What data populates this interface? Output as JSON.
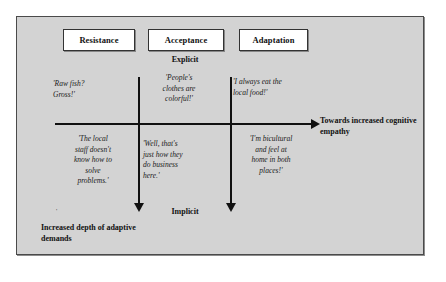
{
  "diagram": {
    "background_color": "#d3d3d3",
    "line_color": "#111111",
    "box_fill_color": "#ffffff",
    "categories": [
      {
        "id": "resistance",
        "label": "Resistance"
      },
      {
        "id": "acceptance",
        "label": "Acceptance"
      },
      {
        "id": "adaptation",
        "label": "Adaptation"
      }
    ],
    "axes": {
      "vertical_top_label": "Explicit",
      "vertical_bottom_label": "Implicit",
      "horizontal_caption_line1": "Towards increased",
      "horizontal_caption_line2": "cognitive empathy",
      "vertical_caption_line1": "Increased depth of",
      "vertical_caption_line2": "adaptive demands"
    },
    "quotes": {
      "resistance_explicit": {
        "lines": [
          "'Raw fish?",
          "Gross!'"
        ]
      },
      "acceptance_explicit": {
        "lines": [
          "'People's",
          "clothes are",
          "colorful!'"
        ]
      },
      "adaptation_explicit": {
        "lines": [
          "'I always eat the",
          "local food!'"
        ]
      },
      "resistance_implicit": {
        "lines": [
          "'The local",
          "staff doesn't",
          "know how to",
          "solve",
          "problems.'"
        ]
      },
      "acceptance_implicit": {
        "lines": [
          "'Well, that's",
          "just how they",
          "do business",
          "here.'"
        ]
      },
      "adaptation_implicit": {
        "lines": [
          "'I'm bicultural",
          "and feel at",
          "home in both",
          "places!'"
        ]
      }
    },
    "artifact_mark": "'"
  }
}
